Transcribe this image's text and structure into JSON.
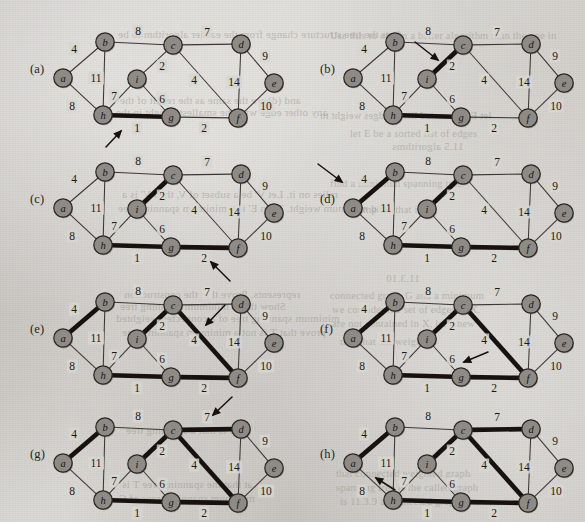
{
  "figure": {
    "node_fill": "#8e8b86",
    "node_stroke": "#2b2724",
    "edge_color": "#3c3733",
    "selected_edge_color": "#17120f",
    "paper_color": "#d7d5d0"
  },
  "nodes": [
    {
      "id": "a",
      "label": "a",
      "x": 55,
      "y": 70
    },
    {
      "id": "b",
      "label": "b",
      "x": 97,
      "y": 34
    },
    {
      "id": "c",
      "label": "c",
      "x": 165,
      "y": 37
    },
    {
      "id": "d",
      "label": "d",
      "x": 233,
      "y": 36
    },
    {
      "id": "e",
      "label": "e",
      "x": 266,
      "y": 75
    },
    {
      "id": "f",
      "label": "f",
      "x": 230,
      "y": 110
    },
    {
      "id": "g",
      "label": "g",
      "x": 163,
      "y": 109
    },
    {
      "id": "h",
      "label": "h",
      "x": 95,
      "y": 107
    },
    {
      "id": "i",
      "label": "i",
      "x": 129,
      "y": 71
    }
  ],
  "edges": [
    {
      "id": "ab",
      "from": "a",
      "to": "b",
      "weight": "4",
      "lx": 66,
      "ly": 41
    },
    {
      "id": "ah",
      "from": "a",
      "to": "h",
      "weight": "8",
      "lx": 64,
      "ly": 98
    },
    {
      "id": "bc",
      "from": "b",
      "to": "c",
      "weight": "8",
      "lx": 130,
      "ly": 23
    },
    {
      "id": "bh",
      "from": "b",
      "to": "h",
      "weight": "11",
      "lx": 88,
      "ly": 70
    },
    {
      "id": "cd",
      "from": "c",
      "to": "d",
      "weight": "7",
      "lx": 199,
      "ly": 24
    },
    {
      "id": "ci",
      "from": "c",
      "to": "i",
      "weight": "2",
      "lx": 154,
      "ly": 58
    },
    {
      "id": "cf",
      "from": "c",
      "to": "f",
      "weight": "4",
      "lx": 186,
      "ly": 72
    },
    {
      "id": "de",
      "from": "d",
      "to": "e",
      "weight": "9",
      "lx": 257,
      "ly": 48
    },
    {
      "id": "df",
      "from": "d",
      "to": "f",
      "weight": "14",
      "lx": 226,
      "ly": 74
    },
    {
      "id": "ef",
      "from": "e",
      "to": "f",
      "weight": "10",
      "lx": 258,
      "ly": 98
    },
    {
      "id": "fg",
      "from": "f",
      "to": "g",
      "weight": "2",
      "lx": 196,
      "ly": 120
    },
    {
      "id": "gh",
      "from": "g",
      "to": "h",
      "weight": "1",
      "lx": 129,
      "ly": 120
    },
    {
      "id": "gi",
      "from": "g",
      "to": "i",
      "weight": "6",
      "lx": 154,
      "ly": 91
    },
    {
      "id": "hi",
      "from": "h",
      "to": "i",
      "weight": "7",
      "lx": 106,
      "ly": 88
    }
  ],
  "panels": [
    {
      "id": "a",
      "label": "(a)",
      "left": 8,
      "top": 8,
      "label_x": 22,
      "label_y": 62,
      "selected": [
        "gh"
      ],
      "arrow": {
        "x1": 98,
        "y1": 139,
        "x2": 113,
        "y2": 123
      },
      "caption": "edge (g,h) weight 1 chosen"
    },
    {
      "id": "b",
      "label": "(b)",
      "left": 298,
      "top": 8,
      "label_x": 22,
      "label_y": 62,
      "selected": [
        "gh",
        "ci"
      ],
      "arrow": {
        "x1": 117,
        "y1": 34,
        "x2": 140,
        "y2": 52
      },
      "caption": "edge (c,i) weight 2 chosen"
    },
    {
      "id": "c",
      "label": "(c)",
      "left": 8,
      "top": 138,
      "label_x": 22,
      "label_y": 62,
      "selected": [
        "gh",
        "ci",
        "fg"
      ],
      "arrow": {
        "x1": 222,
        "y1": 143,
        "x2": 203,
        "y2": 124
      },
      "caption": "edge (f,g) weight 2 chosen"
    },
    {
      "id": "d",
      "label": "(d)",
      "left": 298,
      "top": 138,
      "label_x": 22,
      "label_y": 62,
      "selected": [
        "gh",
        "ci",
        "fg",
        "ab"
      ],
      "arrow": {
        "x1": 20,
        "y1": 26,
        "x2": 44,
        "y2": 44
      },
      "caption": "edge (a,b) weight 4 chosen"
    },
    {
      "id": "e",
      "label": "(e)",
      "left": 8,
      "top": 268,
      "label_x": 22,
      "label_y": 62,
      "selected": [
        "gh",
        "ci",
        "fg",
        "ab",
        "cf"
      ],
      "arrow": {
        "x1": 217,
        "y1": 37,
        "x2": 198,
        "y2": 57
      },
      "caption": "edge (c,f) weight 4 chosen"
    },
    {
      "id": "f",
      "label": "(f)",
      "left": 298,
      "top": 268,
      "label_x": 22,
      "label_y": 62,
      "selected": [
        "gh",
        "ci",
        "fg",
        "ab",
        "cf"
      ],
      "arrow": {
        "x1": 190,
        "y1": 84,
        "x2": 166,
        "y2": 94
      },
      "caption": "edge (g,i) weight 6 rejected - forms a cycle"
    },
    {
      "id": "g",
      "label": "(g)",
      "left": 8,
      "top": 393,
      "label_x": 22,
      "label_y": 62,
      "selected": [
        "gh",
        "ci",
        "fg",
        "ab",
        "cf",
        "cd"
      ],
      "arrow": {
        "x1": 224,
        "y1": 4,
        "x2": 205,
        "y2": 22
      },
      "caption": "edge (c,d) weight 7 chosen"
    },
    {
      "id": "h",
      "label": "(h)",
      "left": 298,
      "top": 393,
      "label_x": 22,
      "label_y": 62,
      "selected": [
        "gh",
        "ci",
        "fg",
        "ab",
        "cf",
        "cd"
      ],
      "arrow": {
        "x1": 97,
        "y1": 97,
        "x2": 78,
        "y2": 85
      },
      "caption": "edge (h,i) weight 7 rejected - forms a cycle"
    }
  ],
  "ghost_text": [
    {
      "text": "does the tree structure change from the earlier algorithm to be",
      "x": 118,
      "y": 28,
      "size": 11,
      "mirror": true
    },
    {
      "text": "Use this to obtain a better algorithm than the one in",
      "x": 330,
      "y": 30,
      "size": 10.5,
      "mirror": false
    },
    {
      "text": "and (d) are the same as the result of the",
      "x": 120,
      "y": 94,
      "size": 11,
      "mirror": true
    },
    {
      "text": "any other edge with the smallest weight in the",
      "x": 116,
      "y": 106,
      "size": 11,
      "mirror": true
    },
    {
      "text": "let E be a sorted list of edges weight to",
      "x": 320,
      "y": 110,
      "size": 10.5,
      "mirror": true
    },
    {
      "text": "let E be a sorted list of edges",
      "x": 350,
      "y": 128,
      "size": 10.5,
      "mirror": false
    },
    {
      "text": "11.5 algorithms",
      "x": 392,
      "y": 140,
      "size": 11,
      "mirror": true
    },
    {
      "text": "relies on it. Let V' be a subset of V, then V' is a",
      "x": 122,
      "y": 188,
      "size": 11,
      "mirror": true
    },
    {
      "text": "and minimum weight. Then E' is a minimum spanning tree",
      "x": 118,
      "y": 202,
      "size": 11,
      "mirror": true
    },
    {
      "text": "find a minimum spanning tree",
      "x": 330,
      "y": 178,
      "size": 10.5,
      "mirror": false
    },
    {
      "text": "implies that it is",
      "x": 360,
      "y": 204,
      "size": 10.5,
      "mirror": false
    },
    {
      "text": "11.3.10",
      "x": 386,
      "y": 272,
      "size": 11,
      "mirror": true
    },
    {
      "text": "represents. Prove that the construction",
      "x": 124,
      "y": 288,
      "size": 11,
      "mirror": true
    },
    {
      "text": "Show that a minimum spanning tree",
      "x": 120,
      "y": 300,
      "size": 11,
      "mirror": true
    },
    {
      "text": "minimum spanning tree of a connected weighted",
      "x": 116,
      "y": 312,
      "size": 11,
      "mirror": true
    },
    {
      "text": "prove that T is not a minimum spanning tree",
      "x": 122,
      "y": 326,
      "size": 11,
      "mirror": true
    },
    {
      "text": "connected graph G and a minimum",
      "x": 330,
      "y": 290,
      "size": 10.5,
      "mirror": false
    },
    {
      "text": "we consider the set of edges in X.",
      "x": 332,
      "y": 304,
      "size": 10.5,
      "mirror": false
    },
    {
      "text": "are not contained in X, let a new",
      "x": 332,
      "y": 318,
      "size": 10.5,
      "mirror": false
    },
    {
      "text": "that that the weight of",
      "x": 340,
      "y": 336,
      "size": 10.5,
      "mirror": false
    },
    {
      "text": "it is that a spanning tree",
      "x": 126,
      "y": 424,
      "size": 11,
      "mirror": true
    },
    {
      "text": "at that the spanning tree T is",
      "x": 122,
      "y": 478,
      "size": 11,
      "mirror": true
    },
    {
      "text": "minimum spanning trees of G",
      "x": 118,
      "y": 492,
      "size": 11,
      "mirror": true
    },
    {
      "text": "that connected weighted graph",
      "x": 336,
      "y": 468,
      "size": 10.5,
      "mirror": false
    },
    {
      "text": "spanning tree is the called graph",
      "x": 336,
      "y": 482,
      "size": 10.5,
      "mirror": false
    },
    {
      "text": "is 11.3.9 a connected graph",
      "x": 340,
      "y": 496,
      "size": 10.5,
      "mirror": false
    }
  ]
}
